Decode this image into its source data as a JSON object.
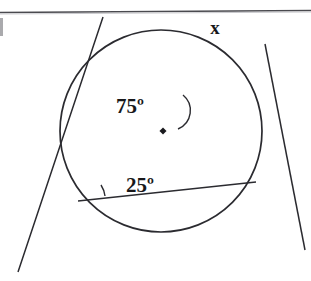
{
  "figure": {
    "background_color": "#ffffff",
    "ink_color": "#2b2b30",
    "top_rule": {
      "name": "horizontal-rule",
      "color": "#4a4a4f",
      "y": 12
    },
    "left_edge_artifact": {
      "name": "page-margin-smudge",
      "color": "#9a9a9f"
    }
  },
  "circle": {
    "center_x": 161,
    "center_y": 131,
    "radius": 101,
    "stroke_color": "#2b2b30",
    "stroke_width": 1.6,
    "center_dot": {
      "x": 163,
      "y": 131,
      "size": 5,
      "color": "#1a1a1e"
    }
  },
  "lines": [
    {
      "name": "secant-ascending",
      "x1": 18,
      "y1": 272,
      "x2": 103,
      "y2": 17,
      "stroke_width": 1.5
    },
    {
      "name": "secant-descending",
      "x1": 265,
      "y1": 44,
      "x2": 305,
      "y2": 250,
      "stroke_width": 1.5
    },
    {
      "name": "chord",
      "x1": 78,
      "y1": 201,
      "x2": 256,
      "y2": 182,
      "stroke_width": 1.5
    }
  ],
  "vertices": [
    {
      "name": "interior-intersection",
      "x": 188,
      "y": 113
    },
    {
      "name": "circle-point-lower-left",
      "x": 78,
      "y": 201
    },
    {
      "name": "exterior-intersection-right",
      "x": 256,
      "y": 182
    }
  ],
  "labels": {
    "angle_interior": {
      "name": "angle-label-75",
      "text": "75º",
      "x": 130,
      "y": 113
    },
    "angle_inscribed": {
      "name": "angle-label-25",
      "text": "25º",
      "x": 113,
      "y": 192
    },
    "unknown_arc": {
      "name": "unknown-label-x",
      "text": "x",
      "x": 215,
      "y": 34
    }
  },
  "arcs": {
    "interior_arc": {
      "name": "angle-arc-75",
      "path": "M 182 96 A 19 19 0 0 1 179 128"
    },
    "inscribed_arc": {
      "name": "angle-arc-25",
      "path": "M 103 189 A 28 28 0 0 1 106 197"
    }
  }
}
